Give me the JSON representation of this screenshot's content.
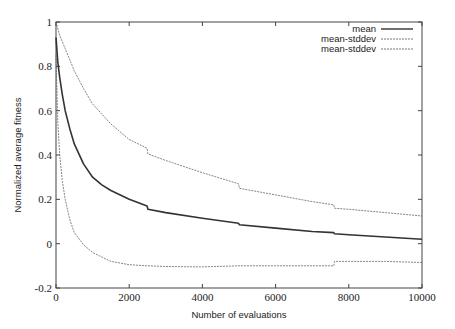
{
  "chart_data": {
    "type": "line",
    "title": "",
    "xlabel": "Number  of evaluations",
    "ylabel": "Normalized  average fitness",
    "xlim": [
      0,
      10000
    ],
    "ylim": [
      -0.2,
      1
    ],
    "grid": false,
    "legend_position": "top-right",
    "x_ticks": [
      0,
      2000,
      4000,
      6000,
      8000,
      10000
    ],
    "x_tick_labels": [
      "0",
      "2000",
      "4000",
      "6000",
      "8000",
      "10000"
    ],
    "y_ticks": [
      -0.2,
      0,
      0.2,
      0.4,
      0.6,
      0.8,
      1
    ],
    "y_tick_labels": [
      "-0.2",
      "0",
      "0.2",
      "0.4",
      "0.6",
      "0.8",
      "1"
    ],
    "series": [
      {
        "name": "mean",
        "style": "solid",
        "x": [
          0,
          50,
          100,
          175,
          250,
          375,
          500,
          750,
          1000,
          1250,
          1500,
          2000,
          2490,
          2510,
          3000,
          4000,
          4990,
          5010,
          6000,
          7000,
          7590,
          7610,
          8000,
          9000,
          10000
        ],
        "values": [
          0.93,
          0.82,
          0.75,
          0.67,
          0.6,
          0.52,
          0.45,
          0.36,
          0.3,
          0.265,
          0.24,
          0.2,
          0.17,
          0.155,
          0.14,
          0.115,
          0.092,
          0.085,
          0.07,
          0.055,
          0.05,
          0.045,
          0.04,
          0.03,
          0.02
        ]
      },
      {
        "name": "mean-stddev",
        "style": "dashed",
        "x": [
          0,
          100,
          250,
          500,
          750,
          1000,
          1500,
          2000,
          2490,
          2510,
          3000,
          4000,
          4990,
          5010,
          6000,
          7000,
          7590,
          7610,
          8000,
          9000,
          10000
        ],
        "values": [
          1.0,
          0.94,
          0.88,
          0.78,
          0.7,
          0.63,
          0.54,
          0.47,
          0.43,
          0.405,
          0.375,
          0.32,
          0.27,
          0.25,
          0.22,
          0.19,
          0.175,
          0.16,
          0.155,
          0.14,
          0.125
        ]
      },
      {
        "name": "mean-stddev",
        "style": "dashed",
        "x": [
          0,
          50,
          100,
          175,
          250,
          375,
          500,
          750,
          1000,
          1500,
          2000,
          2500,
          3000,
          4000,
          5000,
          6000,
          7000,
          7590,
          7610,
          8000,
          9000,
          10000
        ],
        "values": [
          0.85,
          0.55,
          0.4,
          0.28,
          0.2,
          0.11,
          0.05,
          -0.005,
          -0.04,
          -0.08,
          -0.095,
          -0.1,
          -0.103,
          -0.105,
          -0.1,
          -0.1,
          -0.1,
          -0.1,
          -0.08,
          -0.08,
          -0.08,
          -0.085
        ]
      }
    ]
  },
  "legend": {
    "items": [
      {
        "label": "mean",
        "style": "solid"
      },
      {
        "label": "mean-stddev",
        "style": "dashed"
      },
      {
        "label": "mean-stddev",
        "style": "dashed"
      }
    ]
  },
  "colors": {
    "axis": "#444444",
    "series": "#333333"
  }
}
